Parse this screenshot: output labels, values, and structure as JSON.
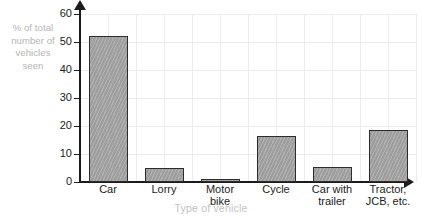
{
  "chart_data": {
    "type": "bar",
    "title": "",
    "categories": [
      "Car",
      "Lorry",
      "Motor\nbike",
      "Cycle",
      "Car with\ntrailer",
      "Tractor,\nJCB, etc."
    ],
    "values": [
      52,
      5,
      1,
      16.5,
      5.5,
      18.5
    ],
    "xlabel": "Type of vehicle",
    "ylabel": "% of total\nnumber of\nvehicles\nseen",
    "ylim": [
      0,
      60
    ],
    "ytick_values": [
      0,
      10,
      20,
      30,
      40,
      50,
      60
    ],
    "ytick_labels": [
      "0",
      "10",
      "20",
      "30",
      "40",
      "50",
      "60"
    ],
    "grid": true,
    "legend": false,
    "bar_fill_color": "#a3a3a3",
    "bar_border_color": "#2c2c2c",
    "axis_color": "#1b1b1b",
    "grid_color": "#ececed",
    "label_color": "#b4b4b4"
  }
}
